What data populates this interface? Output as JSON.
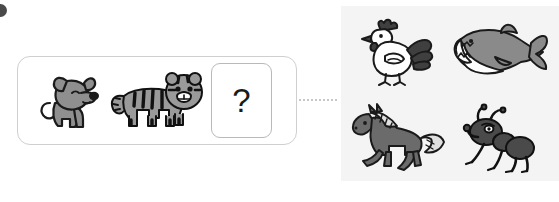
{
  "canvas": {
    "width": 559,
    "height": 202,
    "background": "#ffffff"
  },
  "marker": {
    "name": "bullet-dot",
    "color": "#4a4a4a"
  },
  "question": {
    "panel_label": "analogy-question-panel",
    "border_color": "#cfcfcf",
    "items": [
      {
        "id": "dog",
        "label": "dog",
        "icon": "dog-icon",
        "body_color": "#8f8f8f",
        "outline": "#1a1a1a"
      },
      {
        "id": "tiger",
        "label": "tiger",
        "icon": "tiger-icon",
        "body_color": "#9a9a9a",
        "outline": "#111111"
      }
    ],
    "answer_slot": {
      "label": "unknown-answer",
      "text": "?",
      "border_color": "#b9b9b9"
    }
  },
  "connector": {
    "label": "dotted-connector",
    "style": "dotted",
    "color": "#c6c6c6"
  },
  "options": {
    "panel_label": "answer-options-panel",
    "background": "#f4f4f4",
    "items": [
      {
        "id": "rooster",
        "label": "rooster",
        "icon": "rooster-icon",
        "body_color": "#ffffff",
        "accent_color": "#3f3f3f",
        "outline": "#1a1a1a"
      },
      {
        "id": "shark",
        "label": "shark",
        "icon": "shark-icon",
        "body_color": "#8a8a8a",
        "accent_color": "#ffffff",
        "outline": "#1a1a1a"
      },
      {
        "id": "horse",
        "label": "horse",
        "icon": "horse-icon",
        "body_color": "#6b6b6b",
        "accent_color": "#e0e0e0",
        "outline": "#1a1a1a"
      },
      {
        "id": "ant",
        "label": "ant",
        "icon": "ant-icon",
        "body_color": "#4a4a4a",
        "accent_color": "#ffffff",
        "outline": "#111111"
      }
    ]
  }
}
